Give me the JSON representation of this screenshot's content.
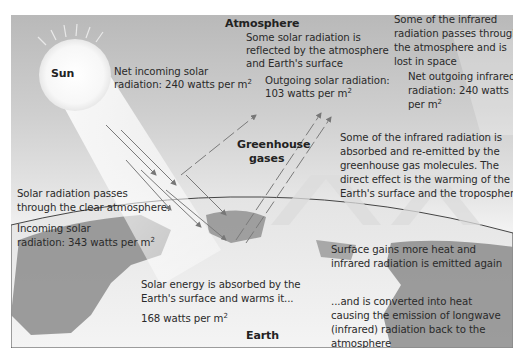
{
  "title_labels": {
    "sun": "Sun",
    "atmosphere": "Atmosphere",
    "greenhouse_gases_line1": "Greenhouse",
    "greenhouse_gases_line2": "gases",
    "earth": "Earth"
  },
  "annotations": {
    "net_incoming": {
      "line1": "Net incoming solar",
      "line2_prefix": "radiation: 240 watts per m",
      "sup": "2"
    },
    "reflected": {
      "line1": "Some solar radiation is",
      "line2": "reflected by the atmosphere",
      "line3": "and Earth's surface"
    },
    "outgoing_solar": {
      "line1": "Outgoing solar radiation:",
      "line2_prefix": "103 watts per m",
      "sup": "2"
    },
    "ir_lost": {
      "line1": "Some of the infrared",
      "line2": "radiation passes through",
      "line3": "the atmosphere and is",
      "line4": "lost in space"
    },
    "net_outgoing_ir": {
      "line1": "Net outgoing infrared",
      "line2": "radiation: 240 watts",
      "line3_prefix": "per m",
      "sup": "2"
    },
    "ir_absorbed": {
      "line1": "Some of the infrared radiation is",
      "line2": "absorbed and re-emitted by the",
      "line3": "greenhouse gas molecules. The",
      "line4": "direct effect is the warming of the",
      "line5": "Earth's surface and the troposphere."
    },
    "passes_clear": {
      "line1": "Solar radiation passes",
      "line2": "through the clear atmosphere."
    },
    "incoming_solar": {
      "line1": "Incoming solar",
      "line2_prefix": "radiation: 343 watts per m",
      "sup": "2"
    },
    "surface_gains": {
      "line1": "Surface gains more heat and",
      "line2": "infrared radiation is emitted again"
    },
    "absorbed_surface": {
      "line1": "Solar energy is absorbed by the",
      "line2": "Earth's surface and warms it...",
      "line3_prefix": "168 watts per m",
      "sup": "2"
    },
    "converted_heat": {
      "line1": "...and is converted into heat",
      "line2": "causing the emission of longwave",
      "line3": "(infrared) radiation back to the",
      "line4": "atmosphere"
    }
  },
  "colors": {
    "sky_top": "#b9b9b9",
    "sky_bottom": "#ffffff",
    "earth_land": "#8f8f8f",
    "earth_ocean": "#d8d8d8",
    "arrow": "#7a7a7a",
    "text": "#2a2a2a"
  }
}
